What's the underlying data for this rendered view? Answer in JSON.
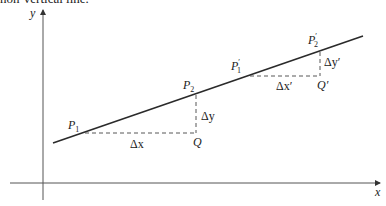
{
  "caption_fragment": "non-vertical line.",
  "axes": {
    "x_label": "x",
    "y_label": "y"
  },
  "points": {
    "p1": {
      "base": "P",
      "sub": "1"
    },
    "p2": {
      "base": "P",
      "sub": "2"
    },
    "p1_prime": {
      "base": "P",
      "prime": "′",
      "sub": "1"
    },
    "p2_prime": {
      "base": "P",
      "prime": "′",
      "sub": "2"
    },
    "q": "Q",
    "q_prime": "Q′"
  },
  "deltas": {
    "dx": "Δx",
    "dy": "Δy",
    "dx_prime": "Δx′",
    "dy_prime": "Δy′"
  },
  "colors": {
    "line": "#2a2a2a",
    "axis": "#555555",
    "dash": "#444444"
  }
}
